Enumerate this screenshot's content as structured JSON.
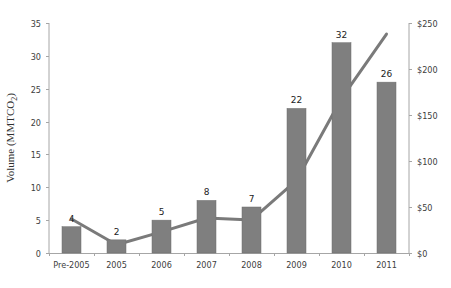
{
  "chart_data": {
    "type": "bar+line",
    "title": "",
    "categories": [
      "Pre-2005",
      "2005",
      "2006",
      "2007",
      "2008",
      "2009",
      "2010",
      "2011"
    ],
    "series": [
      {
        "name": "Volume (MMTCO2)",
        "type": "bar",
        "axis": "left",
        "values": [
          4,
          2,
          5,
          8,
          7,
          22,
          32,
          26
        ],
        "color": "#7f7f7f"
      },
      {
        "name": "Value ($)",
        "type": "line",
        "axis": "right",
        "values": [
          37,
          9,
          23,
          38,
          36,
          79,
          168,
          238
        ],
        "color": "#7a7a7a"
      }
    ],
    "xlabel": "",
    "ylabel": "Volume (MMTCO2)",
    "ylabel_main": "Volume (MMTCO",
    "ylabel_sub": "2",
    "ylabel_close": ")",
    "ylim": [
      0,
      35
    ],
    "y_ticks": [
      0,
      5,
      10,
      15,
      20,
      25,
      30,
      35
    ],
    "y2lim": [
      0,
      250
    ],
    "y2_ticks": [
      "$0",
      "$50",
      "$100",
      "$150",
      "$200",
      "$250"
    ],
    "y2_tick_values": [
      0,
      50,
      100,
      150,
      200,
      250
    ],
    "data_labels": [
      "4",
      "2",
      "5",
      "8",
      "7",
      "22",
      "32",
      "26"
    ],
    "grid": false,
    "legend": "none"
  }
}
